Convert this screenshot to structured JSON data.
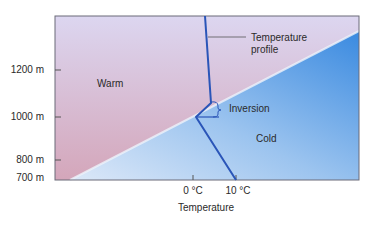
{
  "diagram": {
    "y_axis": {
      "ticks": [
        {
          "label": "1200 m",
          "value": 1200
        },
        {
          "label": "1000 m",
          "value": 1000
        },
        {
          "label": "800 m",
          "value": 800
        },
        {
          "label": "700 m",
          "value": 700
        }
      ]
    },
    "x_axis": {
      "title": "Temperature",
      "ticks": [
        {
          "label": "0 °C",
          "value": 0
        },
        {
          "label": "10 °C",
          "value": 10
        }
      ]
    },
    "regions": {
      "warm": {
        "label": "Warm",
        "color_top": "#d9d3ee",
        "color_bottom": "#d3a9bb"
      },
      "cold": {
        "label": "Cold",
        "color_light": "#d8e6f7",
        "color_dark": "#3f8ee0"
      }
    },
    "annotations": {
      "temperature_profile": {
        "line1": "Temperature",
        "line2": "profile"
      },
      "inversion": "Inversion"
    },
    "profile_color": "#2a55b8"
  }
}
